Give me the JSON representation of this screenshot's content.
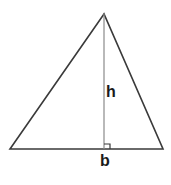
{
  "diagram": {
    "labels": {
      "height": "h",
      "base": "b"
    },
    "points": {
      "apex": [
        104,
        14
      ],
      "bottom_left": [
        10,
        149
      ],
      "bottom_right": [
        163,
        149
      ],
      "foot": [
        104,
        149
      ]
    },
    "colors": {
      "edge": "#3a3a3a",
      "height_line": "#8a8a8a",
      "label": "#1a1a1a",
      "background": "#ffffff"
    }
  }
}
